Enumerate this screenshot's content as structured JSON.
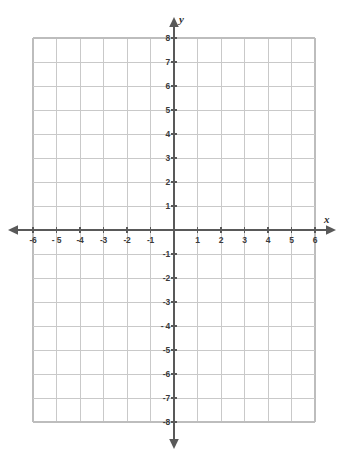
{
  "figure": {
    "kind": "cartesian-coordinate-grid",
    "title": "",
    "background_color": "#ffffff",
    "grid_color": "#c9c9c9",
    "axis_color": "#595959",
    "label_color": "#3a3a3a"
  },
  "axes": {
    "x": {
      "name": "x",
      "min": -6,
      "max": 6,
      "step": 1,
      "tick_labels": [
        "-6",
        "- 5",
        "-4",
        "-3",
        "-2",
        "-1",
        "1",
        "2",
        "3",
        "4",
        "5",
        "6"
      ],
      "tick_values": [
        -6,
        -5,
        -4,
        -3,
        -2,
        -1,
        1,
        2,
        3,
        4,
        5,
        6
      ],
      "arrows": [
        "left",
        "right"
      ]
    },
    "y": {
      "name": "y",
      "min": -8,
      "max": 8,
      "step": 1,
      "tick_labels": [
        "8",
        "7",
        "6",
        "5",
        "4",
        "3",
        "2",
        "1",
        "-1",
        "-2",
        "-3",
        "- 4",
        "-5",
        "-6",
        "-7",
        "-8"
      ],
      "tick_values": [
        8,
        7,
        6,
        5,
        4,
        3,
        2,
        1,
        -1,
        -2,
        -3,
        -4,
        -5,
        -6,
        -7,
        -8
      ],
      "arrows": [
        "up",
        "down"
      ]
    }
  },
  "chart_data": {
    "type": "scatter",
    "title": "",
    "xlabel": "x",
    "ylabel": "y",
    "xlim": [
      -6,
      6
    ],
    "ylim": [
      -8,
      8
    ],
    "xticks": [
      -6,
      -5,
      -4,
      -3,
      -2,
      -1,
      0,
      1,
      2,
      3,
      4,
      5,
      6
    ],
    "yticks": [
      -8,
      -7,
      -6,
      -5,
      -4,
      -3,
      -2,
      -1,
      0,
      1,
      2,
      3,
      4,
      5,
      6,
      7,
      8
    ],
    "xtick_labels": [
      "-6",
      "- 5",
      "-4",
      "-3",
      "-2",
      "-1",
      "",
      "1",
      "2",
      "3",
      "4",
      "5",
      "6"
    ],
    "ytick_labels": [
      "-8",
      "-7",
      "-6",
      "-5",
      "- 4",
      "-3",
      "-2",
      "-1",
      "",
      "1",
      "2",
      "3",
      "4",
      "5",
      "6",
      "7",
      "8"
    ],
    "grid": true,
    "legend": null,
    "series": [],
    "annotations": []
  }
}
